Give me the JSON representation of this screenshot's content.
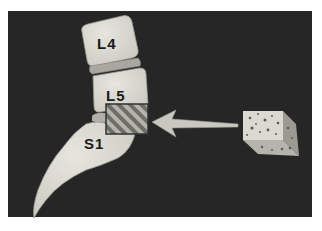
{
  "diagram": {
    "labels": {
      "l4": "L4",
      "l5": "L5",
      "s1": "S1"
    },
    "elements": [
      {
        "name": "vertebra-l4",
        "label": "L4"
      },
      {
        "name": "vertebra-l5",
        "label": "L5"
      },
      {
        "name": "sacrum-s1",
        "label": "S1"
      },
      {
        "name": "graft-site",
        "pattern": "diagonal-stripes"
      },
      {
        "name": "insertion-arrow",
        "direction": "left"
      },
      {
        "name": "bone-graft-block",
        "texture": "porous"
      }
    ],
    "colors": {
      "background": "#262626",
      "bone": "#dcdcd4",
      "disc": "#a8a8a0",
      "stripe_light": "#b0b0a8",
      "stripe_dark": "#707068",
      "arrow": "#c8c8c0",
      "frame": "#ffffff"
    }
  }
}
